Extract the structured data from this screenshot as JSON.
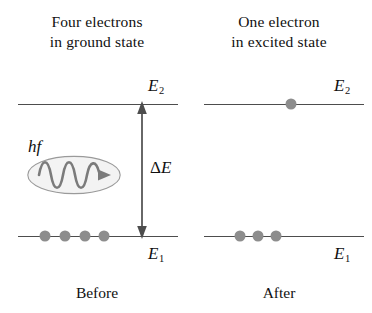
{
  "figure": {
    "panels": [
      {
        "id": "before",
        "caption_line1": "Four electrons",
        "caption_line2": "in ground state",
        "footer": "Before",
        "levels": [
          {
            "name": "E2",
            "label_base": "E",
            "label_sub": "2",
            "electron_count": 0
          },
          {
            "name": "E1",
            "label_base": "E",
            "label_sub": "1",
            "electron_count": 4
          }
        ],
        "annotations": {
          "photon_label": "hf",
          "energy_gap_label_delta": "Δ",
          "energy_gap_label_e": "E",
          "arrow_type": "double-headed-vertical"
        }
      },
      {
        "id": "after",
        "caption_line1": "One electron",
        "caption_line2": "in excited state",
        "footer": "After",
        "levels": [
          {
            "name": "E2",
            "label_base": "E",
            "label_sub": "2",
            "electron_count": 1
          },
          {
            "name": "E1",
            "label_base": "E",
            "label_sub": "1",
            "electron_count": 3
          }
        ],
        "annotations": {}
      }
    ]
  },
  "colors": {
    "line": "#4d4d4d",
    "electron": "#8d8d8d",
    "text": "#101010",
    "wave": "#7d7d7d",
    "ellipse_fill": "#f2f2f2",
    "background": "#ffffff"
  },
  "icons": {
    "electron": "electron-dot",
    "photon": "photon-wave-packet",
    "arrow": "double-headed-arrow"
  }
}
